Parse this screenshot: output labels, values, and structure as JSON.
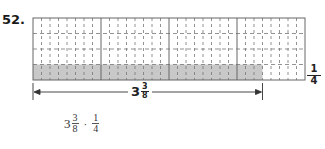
{
  "problem_number": "52.",
  "diagram": {
    "units": 4,
    "columns_per_unit": 8,
    "rows": 4,
    "shaded_row": "bottom",
    "shaded_length": "3 3/8",
    "colors": {
      "shade": "#c8c8c8",
      "grid_solid": "#666666",
      "grid_dashed": "#777777"
    }
  },
  "labels": {
    "row_fraction": {
      "numerator": "1",
      "denominator": "4"
    },
    "length": {
      "whole": "3",
      "numerator": "3",
      "denominator": "8"
    }
  },
  "expression": {
    "term1": {
      "whole": "3",
      "numerator": "3",
      "denominator": "8"
    },
    "operator": "·",
    "term2": {
      "numerator": "1",
      "denominator": "4"
    }
  }
}
